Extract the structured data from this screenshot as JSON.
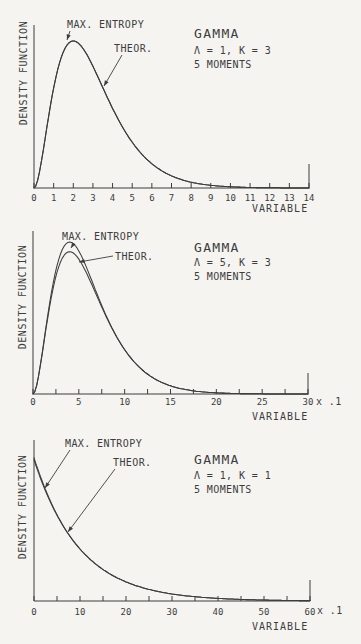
{
  "page": {
    "background": "#f5f4f1",
    "ink": "#3d3d3d"
  },
  "chart_data": [
    {
      "type": "line",
      "title": "GAMMA",
      "params": [
        "Λ = 1, K = 3",
        "5 MOMENTS"
      ],
      "xlabel": "VARIABLE",
      "ylabel": "DENSITY FUNCTION",
      "x_scale_note": "",
      "x_multiplier": 1,
      "xlim": [
        0,
        14
      ],
      "xticks": [
        0,
        1,
        2,
        3,
        4,
        5,
        6,
        7,
        8,
        9,
        10,
        11,
        12,
        13,
        14
      ],
      "minor_tick_step": 1,
      "ylim": [
        0,
        0.3
      ],
      "grid": false,
      "legend_position": "inline-annotations",
      "series": [
        {
          "name": "MAX. ENTROPY",
          "curve": "gamma_pdf",
          "lambda": 1,
          "k": 3,
          "peak_boost": 0
        },
        {
          "name": "THEOR.",
          "curve": "gamma_pdf",
          "lambda": 1,
          "k": 3,
          "peak_boost": 0
        }
      ]
    },
    {
      "type": "line",
      "title": "GAMMA",
      "params": [
        "Λ = 5, K = 3",
        "5 MOMENTS"
      ],
      "xlabel": "VARIABLE",
      "ylabel": "DENSITY FUNCTION",
      "x_scale_note": "x .1",
      "x_multiplier": 0.1,
      "xlim": [
        0,
        30
      ],
      "xticks": [
        0,
        5,
        10,
        15,
        20,
        25,
        30
      ],
      "minor_tick_step": 2.5,
      "ylim": [
        0,
        1.55
      ],
      "grid": false,
      "legend_position": "inline-annotations",
      "series": [
        {
          "name": "MAX. ENTROPY",
          "curve": "gamma_pdf",
          "lambda": 5,
          "k": 3,
          "peak_boost": 0.068
        },
        {
          "name": "THEOR.",
          "curve": "gamma_pdf",
          "lambda": 5,
          "k": 3,
          "peak_boost": 0
        }
      ]
    },
    {
      "type": "line",
      "title": "GAMMA",
      "params": [
        "Λ = 1, K = 1",
        "5 MOMENTS"
      ],
      "xlabel": "VARIABLE",
      "ylabel": "DENSITY FUNCTION",
      "x_scale_note": "x .1",
      "x_multiplier": 0.1,
      "xlim": [
        0,
        60
      ],
      "xticks": [
        0,
        10,
        20,
        30,
        40,
        50,
        60
      ],
      "minor_tick_step": 5,
      "ylim": [
        0,
        1.14
      ],
      "grid": false,
      "legend_position": "inline-annotations",
      "series": [
        {
          "name": "MAX. ENTROPY",
          "curve": "gamma_pdf",
          "lambda": 1,
          "k": 1,
          "peak_boost": 0.015
        },
        {
          "name": "THEOR.",
          "curve": "gamma_pdf",
          "lambda": 1,
          "k": 1,
          "peak_boost": 0
        }
      ]
    }
  ]
}
